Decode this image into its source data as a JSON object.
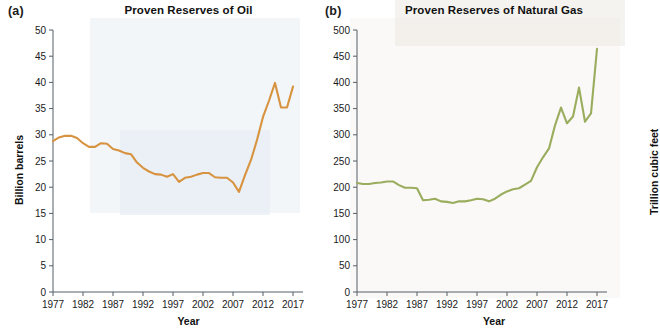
{
  "figure": {
    "panels": [
      {
        "letter": "(a)",
        "title": "Proven Reserves of Oil"
      },
      {
        "letter": "(b)",
        "title": "Proven Reserves of Natural Gas"
      }
    ]
  },
  "chart_data": [
    {
      "type": "line",
      "panel": "(a)",
      "title": "Proven Reserves of Oil",
      "xlabel": "Year",
      "ylabel": "Billion barrels",
      "xlim": [
        1977,
        2017
      ],
      "ylim": [
        0,
        50
      ],
      "xticks": [
        1977,
        1982,
        1987,
        1992,
        1997,
        2002,
        2007,
        2012,
        2017
      ],
      "yticks": [
        0,
        5,
        10,
        15,
        20,
        25,
        30,
        35,
        40,
        45,
        50
      ],
      "grid": false,
      "legend": "none",
      "color": "#d79340",
      "x": [
        1977,
        1978,
        1979,
        1980,
        1981,
        1982,
        1983,
        1984,
        1985,
        1986,
        1987,
        1988,
        1989,
        1990,
        1991,
        1992,
        1993,
        1994,
        1995,
        1996,
        1997,
        1998,
        1999,
        2000,
        2001,
        2002,
        2003,
        2004,
        2005,
        2006,
        2007,
        2008,
        2009,
        2010,
        2011,
        2012,
        2013,
        2014,
        2015,
        2016,
        2017
      ],
      "values": [
        28.8,
        29.5,
        29.8,
        29.8,
        29.4,
        28.4,
        27.7,
        27.7,
        28.4,
        28.3,
        27.3,
        27.0,
        26.5,
        26.3,
        24.7,
        23.7,
        23.0,
        22.5,
        22.4,
        22.0,
        22.5,
        21.0,
        21.8,
        22.0,
        22.4,
        22.7,
        22.7,
        21.9,
        21.8,
        21.8,
        20.9,
        19.1,
        22.3,
        25.2,
        29.0,
        33.4,
        36.5,
        39.9,
        35.2,
        35.2,
        39.2
      ],
      "annotations": []
    },
    {
      "type": "line",
      "panel": "(b)",
      "title": "Proven Reserves of Natural Gas",
      "xlabel": "Year",
      "ylabel": "Trillion cubic feet",
      "xlim": [
        1977,
        2017
      ],
      "ylim": [
        0,
        500
      ],
      "xticks": [
        1977,
        1982,
        1987,
        1992,
        1997,
        2002,
        2007,
        2012,
        2017
      ],
      "yticks": [
        0,
        50,
        100,
        150,
        200,
        250,
        300,
        350,
        400,
        450,
        500
      ],
      "grid": false,
      "legend": "none",
      "color": "#9aad5e",
      "x": [
        1977,
        1978,
        1979,
        1980,
        1981,
        1982,
        1983,
        1984,
        1985,
        1986,
        1987,
        1988,
        1989,
        1990,
        1991,
        1992,
        1993,
        1994,
        1995,
        1996,
        1997,
        1998,
        1999,
        2000,
        2001,
        2002,
        2003,
        2004,
        2005,
        2006,
        2007,
        2008,
        2009,
        2010,
        2011,
        2012,
        2013,
        2014,
        2015,
        2016,
        2017
      ],
      "values": [
        208,
        206,
        206,
        208,
        209,
        211,
        211,
        204,
        199,
        199,
        198,
        175,
        176,
        178,
        173,
        172,
        170,
        173,
        173,
        175,
        178,
        177,
        173,
        178,
        186,
        192,
        196,
        198,
        205,
        212,
        238,
        257,
        274,
        318,
        352,
        322,
        335,
        390,
        325,
        341,
        464
      ],
      "annotations": []
    }
  ]
}
